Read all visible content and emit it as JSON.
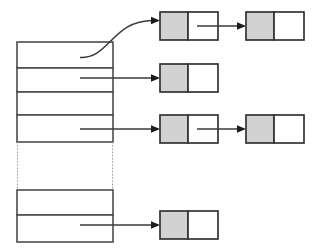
{
  "diagram": {
    "canvas": {
      "width": 321,
      "height": 251,
      "background": "#ffffff"
    },
    "colors": {
      "node_data_fill": "#d2d2d2",
      "node_fill": "#ffffff",
      "node_stroke": "#333333",
      "bucket_stroke": "#4d4d4d",
      "arrow": "#1c1c1c",
      "ellipsis_dotted": "#9a9a9a"
    },
    "bucket_array": {
      "label": "",
      "x": 17,
      "y": 42,
      "width": 96,
      "slots": [
        {
          "index": 0,
          "label": "",
          "y": 42,
          "height": 26,
          "has_chain": true
        },
        {
          "index": 1,
          "label": "",
          "y": 68,
          "height": 24,
          "has_chain": true
        },
        {
          "index": 2,
          "label": "",
          "y": 92,
          "height": 23,
          "has_chain": false
        },
        {
          "index": 3,
          "label": "",
          "y": 115,
          "height": 27,
          "has_chain": true
        },
        {
          "index": 4,
          "label": "",
          "y": 190,
          "height": 25,
          "has_chain": false
        },
        {
          "index": 5,
          "label": "",
          "y": 215,
          "height": 27,
          "has_chain": true
        }
      ],
      "ellipsis_gap": {
        "y": 142,
        "height": 48,
        "style": "dotted"
      }
    },
    "chains": [
      {
        "from_slot": 0,
        "link_style": "curved",
        "nodes": [
          {
            "column": 0,
            "x": 160,
            "y": 12,
            "data_label": "",
            "next_label": "",
            "has_next": true
          },
          {
            "column": 1,
            "x": 246,
            "y": 12,
            "data_label": "",
            "next_label": "",
            "has_next": false
          }
        ]
      },
      {
        "from_slot": 1,
        "link_style": "straight",
        "nodes": [
          {
            "column": 0,
            "x": 160,
            "y": 64,
            "data_label": "",
            "next_label": "",
            "has_next": false
          }
        ]
      },
      {
        "from_slot": 3,
        "link_style": "straight",
        "nodes": [
          {
            "column": 0,
            "x": 160,
            "y": 115,
            "data_label": "",
            "next_label": "",
            "has_next": true
          },
          {
            "column": 1,
            "x": 246,
            "y": 115,
            "data_label": "",
            "next_label": "",
            "has_next": false
          }
        ]
      },
      {
        "from_slot": 5,
        "link_style": "straight",
        "nodes": [
          {
            "column": 0,
            "x": 160,
            "y": 211,
            "data_label": "",
            "next_label": "",
            "has_next": false
          }
        ]
      }
    ],
    "node_geometry": {
      "width": 58,
      "height": 28,
      "data_cell_width": 28,
      "next_cell_width": 30
    }
  }
}
